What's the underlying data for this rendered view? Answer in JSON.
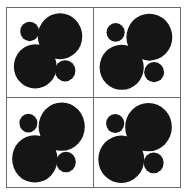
{
  "figure": {
    "title": "",
    "background_color": "#ffffff",
    "frame_color": "#6b6b6b",
    "circle_color": "#151515",
    "panel_rows": 2,
    "panel_cols": 2
  },
  "chart_data": {
    "type": "scatter",
    "title": "",
    "subtitle": "",
    "xlabel": "",
    "ylabel": "",
    "grid": false,
    "legend": null,
    "xlim": [
      0,
      100
    ],
    "ylim": [
      0,
      100
    ],
    "marker_shape": "circle",
    "marker_color": "#151515",
    "panels": [
      {
        "name": "panel-top-left",
        "position": "top-left",
        "circles": [
          {
            "name": "large-upper-right",
            "cx": 62.0,
            "cy": 32.0,
            "r": 26.0
          },
          {
            "name": "large-lower-left",
            "cx": 33.0,
            "cy": 66.0,
            "r": 25.0
          },
          {
            "name": "small-upper-left",
            "cx": 26.5,
            "cy": 26.5,
            "r": 11.0
          },
          {
            "name": "small-lower-right",
            "cx": 68.0,
            "cy": 71.0,
            "r": 12.0
          }
        ]
      },
      {
        "name": "panel-top-right",
        "position": "top-right",
        "circles": [
          {
            "name": "large-upper-right",
            "cx": 64.0,
            "cy": 33.0,
            "r": 26.5
          },
          {
            "name": "large-lower-left",
            "cx": 32.0,
            "cy": 67.0,
            "r": 25.5
          },
          {
            "name": "small-upper-left",
            "cx": 25.0,
            "cy": 27.5,
            "r": 10.5
          },
          {
            "name": "small-lower-right",
            "cx": 69.5,
            "cy": 72.5,
            "r": 11.5
          }
        ]
      },
      {
        "name": "panel-bottom-left",
        "position": "bottom-left",
        "circles": [
          {
            "name": "large-upper-right",
            "cx": 64.0,
            "cy": 32.0,
            "r": 27.0
          },
          {
            "name": "large-lower-left",
            "cx": 32.5,
            "cy": 68.0,
            "r": 26.5
          },
          {
            "name": "small-upper-left",
            "cx": 25.0,
            "cy": 28.0,
            "r": 10.5
          },
          {
            "name": "small-lower-right",
            "cx": 69.0,
            "cy": 71.5,
            "r": 11.5
          }
        ]
      },
      {
        "name": "panel-bottom-right",
        "position": "bottom-right",
        "circles": [
          {
            "name": "large-upper-right",
            "cx": 63.0,
            "cy": 32.5,
            "r": 27.0
          },
          {
            "name": "large-lower-left",
            "cx": 31.5,
            "cy": 68.5,
            "r": 26.5
          },
          {
            "name": "small-upper-left",
            "cx": 24.5,
            "cy": 28.5,
            "r": 10.5
          },
          {
            "name": "small-lower-right",
            "cx": 69.0,
            "cy": 72.5,
            "r": 11.5
          }
        ]
      }
    ]
  }
}
